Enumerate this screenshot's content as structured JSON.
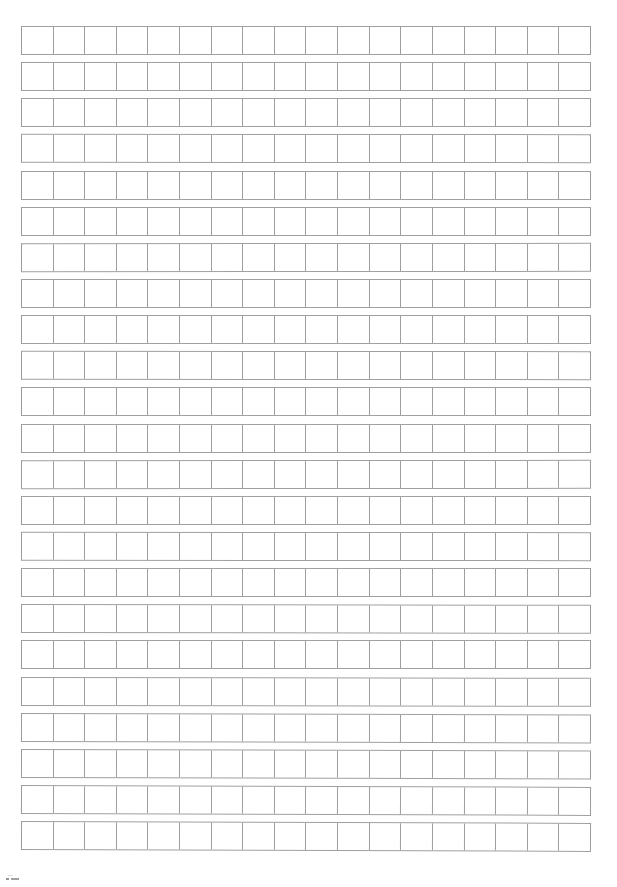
{
  "document": {
    "type": "manuscript-grid-paper",
    "description": "Blank scanned manuscript writing grid (genko yoshi style) — no printed text, headings, labels or numbers appear anywhere on the sheet.",
    "page_background_color": "#ffffff",
    "grid_line_color": "#9e9e9e",
    "grid_border_color": "#a0a0a0"
  },
  "grid": {
    "rows": 23,
    "columns": 18,
    "cell_contents": [
      [
        "",
        "",
        "",
        "",
        "",
        "",
        "",
        "",
        "",
        "",
        "",
        "",
        "",
        "",
        "",
        "",
        "",
        ""
      ],
      [
        "",
        "",
        "",
        "",
        "",
        "",
        "",
        "",
        "",
        "",
        "",
        "",
        "",
        "",
        "",
        "",
        "",
        ""
      ],
      [
        "",
        "",
        "",
        "",
        "",
        "",
        "",
        "",
        "",
        "",
        "",
        "",
        "",
        "",
        "",
        "",
        "",
        ""
      ],
      [
        "",
        "",
        "",
        "",
        "",
        "",
        "",
        "",
        "",
        "",
        "",
        "",
        "",
        "",
        "",
        "",
        "",
        ""
      ],
      [
        "",
        "",
        "",
        "",
        "",
        "",
        "",
        "",
        "",
        "",
        "",
        "",
        "",
        "",
        "",
        "",
        "",
        ""
      ],
      [
        "",
        "",
        "",
        "",
        "",
        "",
        "",
        "",
        "",
        "",
        "",
        "",
        "",
        "",
        "",
        "",
        "",
        ""
      ],
      [
        "",
        "",
        "",
        "",
        "",
        "",
        "",
        "",
        "",
        "",
        "",
        "",
        "",
        "",
        "",
        "",
        "",
        ""
      ],
      [
        "",
        "",
        "",
        "",
        "",
        "",
        "",
        "",
        "",
        "",
        "",
        "",
        "",
        "",
        "",
        "",
        "",
        ""
      ],
      [
        "",
        "",
        "",
        "",
        "",
        "",
        "",
        "",
        "",
        "",
        "",
        "",
        "",
        "",
        "",
        "",
        "",
        ""
      ],
      [
        "",
        "",
        "",
        "",
        "",
        "",
        "",
        "",
        "",
        "",
        "",
        "",
        "",
        "",
        "",
        "",
        "",
        ""
      ],
      [
        "",
        "",
        "",
        "",
        "",
        "",
        "",
        "",
        "",
        "",
        "",
        "",
        "",
        "",
        "",
        "",
        "",
        ""
      ],
      [
        "",
        "",
        "",
        "",
        "",
        "",
        "",
        "",
        "",
        "",
        "",
        "",
        "",
        "",
        "",
        "",
        "",
        ""
      ],
      [
        "",
        "",
        "",
        "",
        "",
        "",
        "",
        "",
        "",
        "",
        "",
        "",
        "",
        "",
        "",
        "",
        "",
        ""
      ],
      [
        "",
        "",
        "",
        "",
        "",
        "",
        "",
        "",
        "",
        "",
        "",
        "",
        "",
        "",
        "",
        "",
        "",
        ""
      ],
      [
        "",
        "",
        "",
        "",
        "",
        "",
        "",
        "",
        "",
        "",
        "",
        "",
        "",
        "",
        "",
        "",
        "",
        ""
      ],
      [
        "",
        "",
        "",
        "",
        "",
        "",
        "",
        "",
        "",
        "",
        "",
        "",
        "",
        "",
        "",
        "",
        "",
        ""
      ],
      [
        "",
        "",
        "",
        "",
        "",
        "",
        "",
        "",
        "",
        "",
        "",
        "",
        "",
        "",
        "",
        "",
        "",
        ""
      ],
      [
        "",
        "",
        "",
        "",
        "",
        "",
        "",
        "",
        "",
        "",
        "",
        "",
        "",
        "",
        "",
        "",
        "",
        ""
      ],
      [
        "",
        "",
        "",
        "",
        "",
        "",
        "",
        "",
        "",
        "",
        "",
        "",
        "",
        "",
        "",
        "",
        "",
        ""
      ],
      [
        "",
        "",
        "",
        "",
        "",
        "",
        "",
        "",
        "",
        "",
        "",
        "",
        "",
        "",
        "",
        "",
        "",
        ""
      ],
      [
        "",
        "",
        "",
        "",
        "",
        "",
        "",
        "",
        "",
        "",
        "",
        "",
        "",
        "",
        "",
        "",
        "",
        ""
      ],
      [
        "",
        "",
        "",
        "",
        "",
        "",
        "",
        "",
        "",
        "",
        "",
        "",
        "",
        "",
        "",
        "",
        "",
        ""
      ],
      [
        "",
        "",
        "",
        "",
        "",
        "",
        "",
        "",
        "",
        "",
        "",
        "",
        "",
        "",
        "",
        "",
        "",
        ""
      ]
    ]
  },
  "artifacts": {
    "bottom_left_speck": ""
  }
}
